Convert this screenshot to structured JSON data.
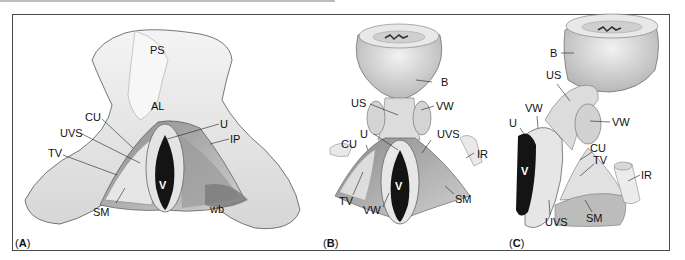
{
  "figure": {
    "panels": [
      {
        "id": "A",
        "label_open": "(",
        "label_letter": "A",
        "label_close": ")",
        "labels": {
          "PS": "PS",
          "AL": "AL",
          "CU": "CU",
          "UVS": "UVS",
          "TV": "TV",
          "U": "U",
          "IP": "IP",
          "V": "V",
          "SM": "SM",
          "wb": "wb"
        }
      },
      {
        "id": "B",
        "label_open": "(",
        "label_letter": "B",
        "label_close": ")",
        "labels": {
          "B": "B",
          "US": "US",
          "VW_top": "VW",
          "U": "U",
          "CU": "CU",
          "UVS": "UVS",
          "IR": "IR",
          "V": "V",
          "TV": "TV",
          "VW_bottom": "VW",
          "SM": "SM"
        }
      },
      {
        "id": "C",
        "label_open": "(",
        "label_letter": "C",
        "label_close": ")",
        "labels": {
          "B": "B",
          "US": "US",
          "VW_left": "VW",
          "VW_right": "VW",
          "U": "U",
          "V": "V",
          "CU": "CU",
          "TV": "TV",
          "IR": "IR",
          "UVS": "UVS",
          "SM": "SM"
        }
      }
    ],
    "colors": {
      "frame": "#4a4a4a",
      "tissue_light": "#e9e9e9",
      "tissue_mid": "#bdbdbd",
      "tissue_dark": "#6e6e6e",
      "lumen": "#111111"
    }
  }
}
